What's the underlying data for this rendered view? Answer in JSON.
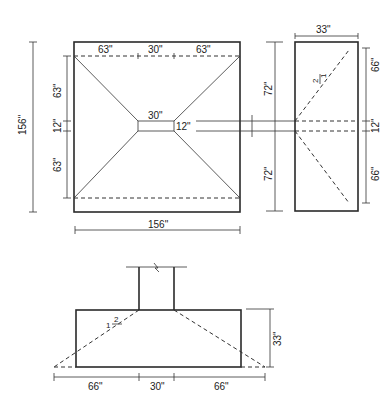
{
  "figure": {
    "plan_view": {
      "overall_height_label": "156\"",
      "overall_width_label": "156\"",
      "top_segments": [
        "63\"",
        "30\"",
        "63\""
      ],
      "left_segments": [
        "63\"",
        "12\"",
        "63\""
      ],
      "center_width_label": "30\"",
      "center_height_label": "12\""
    },
    "side_view": {
      "width_label": "33\"",
      "left_segments": [
        "72\"",
        "72\""
      ],
      "right_segments": [
        "66\"",
        "12\"",
        "66\""
      ],
      "slope_rise": "2",
      "slope_run": "1"
    },
    "section_view": {
      "height_label": "33\"",
      "bottom_segments": [
        "66\"",
        "30\"",
        "66\""
      ],
      "slope_rise": "1",
      "slope_run": "2"
    }
  }
}
